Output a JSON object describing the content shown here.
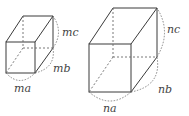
{
  "figure": {
    "small_box": {
      "labels": {
        "a": "ma",
        "b": "mb",
        "c": "mc"
      }
    },
    "large_box": {
      "labels": {
        "a": "na",
        "b": "nb",
        "c": "nc"
      }
    }
  }
}
